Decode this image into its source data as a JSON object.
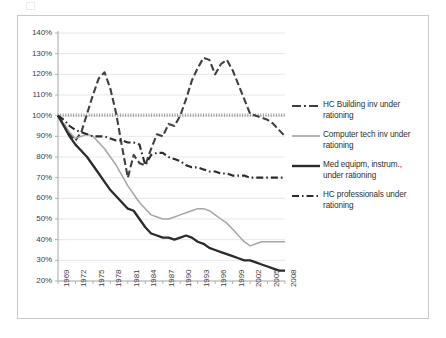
{
  "chart_data": {
    "type": "line",
    "title": "",
    "xlabel": "",
    "ylabel": "",
    "grid": true,
    "legend_position": "right",
    "ylim": [
      20,
      140
    ],
    "ytick_labels": [
      "140%",
      "130%",
      "120%",
      "110%",
      "100%",
      "90%",
      "80%",
      "70%",
      "60%",
      "50%",
      "40%",
      "30%",
      "20%"
    ],
    "ytick_values": [
      140,
      130,
      120,
      110,
      100,
      90,
      80,
      70,
      60,
      50,
      40,
      30,
      20
    ],
    "xtick_labels": [
      "1969",
      "1972",
      "1975",
      "1978",
      "1981",
      "1984",
      "1987",
      "1990",
      "1993",
      "1996",
      "1999",
      "2002",
      "2005",
      "2008"
    ],
    "xtick_values": [
      1969,
      1972,
      1975,
      1978,
      1981,
      1984,
      1987,
      1990,
      1993,
      1996,
      1999,
      2002,
      2005,
      2008
    ],
    "xlim": [
      1969,
      2008
    ],
    "x": [
      1969,
      1970,
      1971,
      1972,
      1973,
      1974,
      1975,
      1976,
      1977,
      1978,
      1979,
      1980,
      1981,
      1982,
      1983,
      1984,
      1985,
      1986,
      1987,
      1988,
      1989,
      1990,
      1991,
      1992,
      1993,
      1994,
      1995,
      1996,
      1997,
      1998,
      1999,
      2000,
      2001,
      2002,
      2003,
      2004,
      2005,
      2006,
      2007,
      2008
    ],
    "series": [
      {
        "name": "HC Building inv under rationing",
        "style": "dashed",
        "color": "#404040",
        "width": 2.1,
        "values": [
          100,
          96,
          91,
          88,
          92,
          101,
          110,
          118,
          121,
          113,
          101,
          85,
          70,
          81,
          77,
          76,
          84,
          91,
          90,
          96,
          95,
          100,
          108,
          117,
          123,
          128,
          127,
          120,
          125,
          127,
          122,
          115,
          108,
          101,
          100,
          99,
          98,
          96,
          93,
          90
        ]
      },
      {
        "name": "Computer tech inv under rationing",
        "style": "solid",
        "color": "#a6a6a6",
        "width": 1.5,
        "values": [
          100,
          96,
          92,
          89,
          90,
          91,
          90,
          87,
          84,
          80,
          76,
          71,
          66,
          62,
          58,
          55,
          52,
          51,
          50,
          50,
          51,
          52,
          53,
          54,
          55,
          55,
          54,
          52,
          50,
          48,
          45,
          42,
          39,
          37,
          38,
          39,
          39,
          39,
          39,
          39
        ]
      },
      {
        "name": "Med equipm, instrum., under rationing",
        "style": "solid",
        "color": "#2b2b2b",
        "width": 2.3,
        "values": [
          100,
          95,
          90,
          86,
          83,
          80,
          76,
          72,
          68,
          64,
          61,
          58,
          55,
          54,
          50,
          46,
          43,
          42,
          41,
          41,
          40,
          41,
          42,
          41,
          39,
          38,
          36,
          35,
          34,
          33,
          32,
          31,
          30,
          30,
          29,
          28,
          27,
          26,
          25,
          25
        ]
      },
      {
        "name": "HC professionals under rationing",
        "style": "dashdot",
        "color": "#2b2b2b",
        "width": 2.1,
        "values": [
          100,
          98,
          95,
          93,
          92,
          91,
          90,
          90,
          90,
          89,
          88,
          88,
          87,
          87,
          86,
          76,
          81,
          82,
          82,
          80,
          79,
          78,
          76,
          75,
          75,
          74,
          73,
          73,
          72,
          72,
          71,
          71,
          71,
          70,
          70,
          70,
          70,
          70,
          70,
          70
        ]
      }
    ]
  },
  "legend": {
    "items": [
      {
        "label_line1": "HC Building inv under",
        "label_line2": "rationing"
      },
      {
        "label_line1": "Computer tech inv under",
        "label_line2": "rationing"
      },
      {
        "label_line1": "Med equipm, instrum.,",
        "label_line2": "under rationing"
      },
      {
        "label_line1": "HC professionals under",
        "label_line2": "rationing"
      }
    ]
  },
  "colors": {
    "frame": "#c9c9c9",
    "grid": "#e2e2e2",
    "axis": "#b0b0b0",
    "text": "#3d3d3d"
  }
}
